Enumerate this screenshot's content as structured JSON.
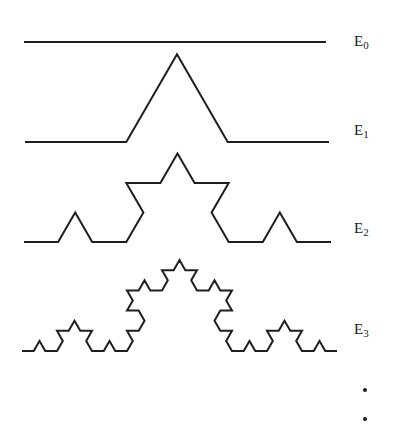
{
  "figure": {
    "stages": [
      {
        "id": "E0",
        "letter": "E",
        "subscript": "0",
        "level": 0,
        "start": [
          24,
          42
        ],
        "end": [
          326,
          42
        ],
        "label_pos": [
          354,
          34
        ]
      },
      {
        "id": "E1",
        "letter": "E",
        "subscript": "1",
        "level": 1,
        "start": [
          25,
          142
        ],
        "end": [
          329,
          142
        ],
        "label_pos": [
          354,
          123
        ]
      },
      {
        "id": "E2",
        "letter": "E",
        "subscript": "2",
        "level": 2,
        "start": [
          24,
          242
        ],
        "end": [
          331,
          242
        ],
        "label_pos": [
          354,
          221
        ]
      },
      {
        "id": "E3",
        "letter": "E",
        "subscript": "3",
        "level": 3,
        "start": [
          22,
          351
        ],
        "end": [
          337,
          351
        ],
        "label_pos": [
          354,
          322
        ]
      }
    ],
    "continuation": {
      "symbol": "⋮",
      "dots": [
        [
          363,
          388
        ],
        [
          363,
          417
        ]
      ]
    },
    "stroke_color": "#1e1e1e"
  }
}
